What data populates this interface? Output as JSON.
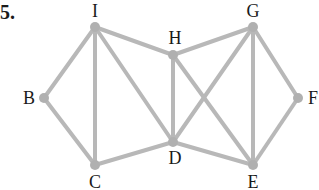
{
  "problem": {
    "number": "5."
  },
  "style": {
    "edge_color": "#b8b8b8",
    "node_color": "#b0b0b0",
    "label_color": "#1a1a1a",
    "edge_width": 4,
    "node_radius": 5
  },
  "nodes": [
    {
      "id": "I",
      "label": "I",
      "x": 95,
      "y": 27,
      "lx": 95,
      "ly": 11
    },
    {
      "id": "H",
      "label": "H",
      "x": 173,
      "y": 55,
      "lx": 175,
      "ly": 38
    },
    {
      "id": "G",
      "label": "G",
      "x": 253,
      "y": 27,
      "lx": 253,
      "ly": 11
    },
    {
      "id": "B",
      "label": "B",
      "x": 44,
      "y": 98,
      "lx": 29,
      "ly": 98
    },
    {
      "id": "F",
      "label": "F",
      "x": 298,
      "y": 98,
      "lx": 313,
      "ly": 98
    },
    {
      "id": "C",
      "label": "C",
      "x": 95,
      "y": 165,
      "lx": 95,
      "ly": 182
    },
    {
      "id": "D",
      "label": "D",
      "x": 173,
      "y": 142,
      "lx": 175,
      "ly": 158
    },
    {
      "id": "E",
      "label": "E",
      "x": 253,
      "y": 165,
      "lx": 253,
      "ly": 182
    }
  ],
  "edges": [
    [
      "I",
      "B"
    ],
    [
      "I",
      "C"
    ],
    [
      "I",
      "D"
    ],
    [
      "I",
      "H"
    ],
    [
      "B",
      "C"
    ],
    [
      "C",
      "D"
    ],
    [
      "H",
      "D"
    ],
    [
      "H",
      "G"
    ],
    [
      "H",
      "E"
    ],
    [
      "D",
      "G"
    ],
    [
      "D",
      "E"
    ],
    [
      "G",
      "E"
    ],
    [
      "G",
      "F"
    ],
    [
      "F",
      "E"
    ]
  ]
}
